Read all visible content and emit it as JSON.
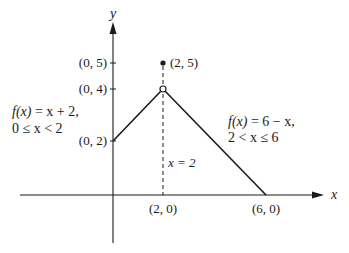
{
  "diagram": {
    "type": "piecewise-function-graph",
    "axes": {
      "x_label": "x",
      "y_label": "y"
    },
    "y_tick_labels": [
      "(0, 5)",
      "(0, 4)",
      "(0, 2)"
    ],
    "x_tick_labels": [
      "(2, 0)",
      "(6, 0)"
    ],
    "points": {
      "filled": {
        "label": "(2, 5)",
        "x": 2,
        "y": 5
      },
      "open": {
        "x": 2,
        "y": 4
      }
    },
    "pieces": [
      {
        "formula_prefix": "f(x)",
        "formula_rest": " = x + 2,",
        "domain": "0 ≤ x < 2",
        "from": [
          0,
          2
        ],
        "to": [
          2,
          4
        ]
      },
      {
        "formula_prefix": "f(x)",
        "formula_rest": " = 6 − x,",
        "domain": "2 < x ≤ 6",
        "from": [
          2,
          4
        ],
        "to": [
          6,
          0
        ]
      }
    ],
    "dashed_line_label": "x = 2",
    "colors": {
      "ink": "#1a1a1a",
      "background": "#ffffff"
    }
  }
}
